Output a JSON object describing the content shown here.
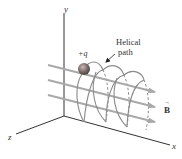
{
  "diagram": {
    "axes": {
      "x_label": "x",
      "y_label": "y",
      "z_label": "z"
    },
    "charge_label": "+q",
    "path_label_line1": "Helical",
    "path_label_line2": "path",
    "field_label": "B",
    "field_vector_arrow": "→",
    "colors": {
      "axis": "#333333",
      "field_lines": "#a9a9a9",
      "helix": "#8a8a8a",
      "charge": "#7a6a6a",
      "text": "#333333"
    }
  }
}
